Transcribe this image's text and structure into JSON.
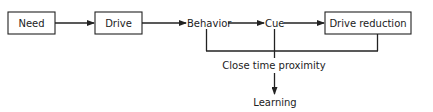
{
  "diagram": {
    "nodes": [
      {
        "id": "need",
        "label": "Need",
        "boxed": true
      },
      {
        "id": "drive",
        "label": "Drive",
        "boxed": true
      },
      {
        "id": "behavior",
        "label": "Behavior",
        "boxed": false
      },
      {
        "id": "cue",
        "label": "Cue",
        "boxed": false
      },
      {
        "id": "drive_reduction",
        "label": "Drive reduction",
        "boxed": true
      },
      {
        "id": "close_time_proximity",
        "label": "Close time proximity",
        "boxed": false
      },
      {
        "id": "learning",
        "label": "Learning",
        "boxed": false
      }
    ],
    "edges": [
      {
        "from": "need",
        "to": "drive"
      },
      {
        "from": "drive",
        "to": "behavior"
      },
      {
        "from": "behavior",
        "to": "cue"
      },
      {
        "from": "cue",
        "to": "drive_reduction"
      },
      {
        "from": [
          "behavior",
          "cue",
          "drive_reduction"
        ],
        "to": "close_time_proximity",
        "type": "bracket"
      },
      {
        "from": "close_time_proximity",
        "to": "learning"
      }
    ],
    "colors": {
      "line": "#222222",
      "background": "#ffffff"
    }
  }
}
